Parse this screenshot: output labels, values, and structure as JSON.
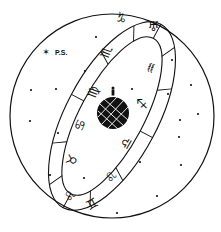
{
  "diagram": {
    "pole_star_label": "P.S.",
    "colors": {
      "ink": "#111111",
      "background": "#ffffff",
      "globe": "#111111",
      "grid": "#ffffff"
    },
    "zodiac_band": [
      {
        "sign": "Capricorn",
        "glyph": "♑",
        "x": 121,
        "y": 18,
        "rot": 30
      },
      {
        "sign": "Aquarius-back",
        "glyph": "♅",
        "x": 152,
        "y": 25,
        "rot": 15
      },
      {
        "sign": "Aquarius",
        "glyph": "♒",
        "x": 151,
        "y": 68,
        "rot": -70
      },
      {
        "sign": "Sagittarius",
        "glyph": "♐",
        "x": 140,
        "y": 107,
        "rot": -90
      },
      {
        "sign": "Libra",
        "glyph": "♎",
        "x": 125,
        "y": 146,
        "rot": -60
      },
      {
        "sign": "Leo",
        "glyph": "♌",
        "x": 104,
        "y": 184,
        "rot": -60
      },
      {
        "sign": "Gemini",
        "glyph": "♊",
        "x": 89,
        "y": 206,
        "rot": -30
      },
      {
        "sign": "Leo-back",
        "glyph": "♌",
        "x": 66,
        "y": 199,
        "rot": -60
      },
      {
        "sign": "Taurus",
        "glyph": "♉",
        "x": 70,
        "y": 159,
        "rot": -70
      },
      {
        "sign": "Cancer",
        "glyph": "♋",
        "x": 77,
        "y": 124,
        "rot": -70
      },
      {
        "sign": "Virgo",
        "glyph": "♍",
        "x": 91,
        "y": 90,
        "rot": -70
      },
      {
        "sign": "Scorpio",
        "glyph": "♏",
        "x": 108,
        "y": 52,
        "rot": -70
      }
    ],
    "stars": [
      {
        "x": 45,
        "y": 52
      },
      {
        "x": 96,
        "y": 37
      },
      {
        "x": 85,
        "y": 71
      },
      {
        "x": 31,
        "y": 90
      },
      {
        "x": 56,
        "y": 89
      },
      {
        "x": 172,
        "y": 60
      },
      {
        "x": 191,
        "y": 85
      },
      {
        "x": 132,
        "y": 89
      },
      {
        "x": 168,
        "y": 94
      },
      {
        "x": 198,
        "y": 114
      },
      {
        "x": 30,
        "y": 119
      },
      {
        "x": 58,
        "y": 133
      },
      {
        "x": 178,
        "y": 137
      },
      {
        "x": 185,
        "y": 165
      },
      {
        "x": 50,
        "y": 175
      },
      {
        "x": 84,
        "y": 178
      },
      {
        "x": 140,
        "y": 162
      },
      {
        "x": 157,
        "y": 195
      },
      {
        "x": 117,
        "y": 212
      },
      {
        "x": 179,
        "y": 120
      }
    ]
  }
}
